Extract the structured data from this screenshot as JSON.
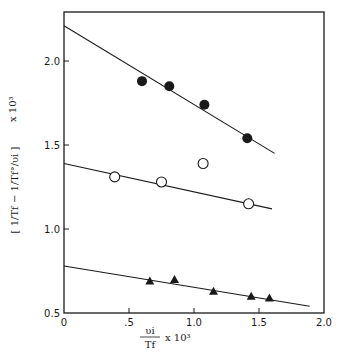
{
  "chart_data": {
    "type": "scatter",
    "title": "",
    "xlabel": "υi / Tf × 10³",
    "ylabel": "[1/Tf − 1/Tf°/υi] × 10³",
    "xlim": [
      0,
      2.0
    ],
    "ylim": [
      0.5,
      2.25
    ],
    "x_ticks": [
      0,
      0.5,
      1.0,
      1.5,
      2.0
    ],
    "x_tick_labels": [
      "0",
      ".5",
      "1.0",
      "1.5",
      "2.0"
    ],
    "y_ticks": [
      0.5,
      1.0,
      1.5,
      2.0
    ],
    "y_tick_labels": [
      "0.5",
      "1.0",
      "1.5",
      "2.0"
    ],
    "grid": false,
    "legend": null,
    "series": [
      {
        "name": "filled circles",
        "marker": "filled-circle",
        "x": [
          0.6,
          0.81,
          1.08,
          1.41
        ],
        "y": [
          1.88,
          1.85,
          1.74,
          1.54
        ],
        "fit_line": {
          "x": [
            0,
            1.62
          ],
          "y": [
            2.21,
            1.45
          ]
        }
      },
      {
        "name": "open circles",
        "marker": "open-circle",
        "x": [
          0.39,
          0.75,
          1.07,
          1.42
        ],
        "y": [
          1.31,
          1.28,
          1.39,
          1.15
        ],
        "fit_line": {
          "x": [
            0,
            1.6
          ],
          "y": [
            1.39,
            1.12
          ]
        }
      },
      {
        "name": "filled triangles",
        "marker": "filled-triangle",
        "x": [
          0.66,
          0.85,
          1.15,
          1.44,
          1.58
        ],
        "y": [
          0.69,
          0.7,
          0.63,
          0.6,
          0.59
        ],
        "fit_line": {
          "x": [
            0,
            1.89
          ],
          "y": [
            0.78,
            0.54
          ]
        }
      }
    ]
  },
  "axes": {
    "x_label_num": "υi",
    "x_label_den": "Tf",
    "x_label_suffix": "x 10³",
    "y_label": "[ 1/Tf − 1/Tf°/υi ]",
    "y_label_suffix": "x 10³"
  }
}
